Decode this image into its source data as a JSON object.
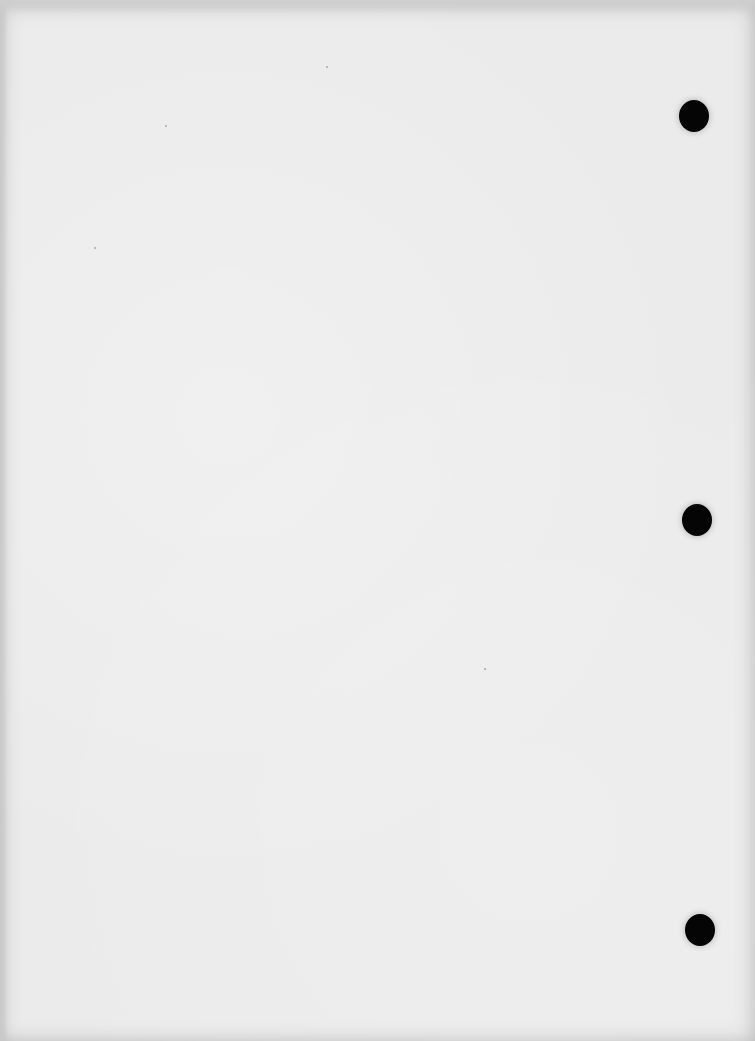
{
  "document": {
    "type": "blank scanned page",
    "background_color": "#ebebeb",
    "hole_color": "#050505",
    "punch_holes": [
      {
        "id": "top",
        "x": 679,
        "y": 100,
        "w": 30,
        "h": 32
      },
      {
        "id": "middle",
        "x": 682,
        "y": 504,
        "w": 30,
        "h": 32
      },
      {
        "id": "bottom",
        "x": 685,
        "y": 914,
        "w": 30,
        "h": 32
      }
    ]
  }
}
